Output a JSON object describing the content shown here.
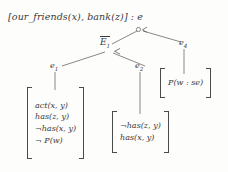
{
  "figure": {
    "title_line": "[our_friends(x), bank(z)] : e",
    "background_color": "#fdfdfc",
    "ink_color": "#3a3a3a"
  },
  "root": {
    "label": "[our_friends(x), bank(z)] : e"
  },
  "nodes": [
    {
      "id": "e-bar-1",
      "label_letter": "E",
      "label_sub": "1",
      "has_overline": true
    },
    {
      "id": "e1",
      "label_letter": "e",
      "label_sub": "1"
    },
    {
      "id": "e2",
      "label_letter": "e",
      "label_sub": "2"
    },
    {
      "id": "e4",
      "label_letter": "e",
      "label_sub": "4"
    }
  ],
  "matrices": [
    {
      "id": "matrix-e1",
      "rows": [
        {
          "neg": "",
          "text": "act(x, y)"
        },
        {
          "neg": "",
          "text": "has(z, y)"
        },
        {
          "neg": "¬",
          "text": "has(x, y)"
        },
        {
          "neg": "¬ ",
          "text": "P(w)"
        }
      ]
    },
    {
      "id": "matrix-e2",
      "rows": [
        {
          "neg": "¬",
          "text": "has(z, y)"
        },
        {
          "neg": "",
          "text": "has(x, y)"
        }
      ]
    },
    {
      "id": "matrix-e4",
      "rows": [
        {
          "neg": "",
          "text": "P(w : se)"
        }
      ]
    }
  ],
  "annotations": {
    "junction_circle": "circle-marker",
    "arrowheads": "arrowhead-marker"
  }
}
